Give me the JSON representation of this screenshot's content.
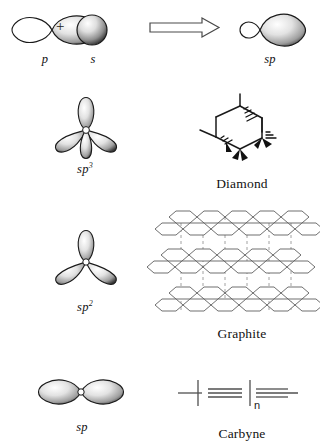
{
  "figure": {
    "background_color": "#ffffff",
    "ink_color": "#1a1a1a",
    "plus_symbol": "+",
    "rows": [
      {
        "id": "row-sp-formation",
        "orbital_labels": [
          "p",
          "s"
        ],
        "operator": "+",
        "arrow": "right-block-arrow",
        "result_label": "sp",
        "material_label": ""
      },
      {
        "id": "row-sp3-diamond",
        "orbital_labels": [
          "sp3"
        ],
        "orbital_label_base": "sp",
        "orbital_label_sup": "3",
        "material_label": "Diamond"
      },
      {
        "id": "row-sp2-graphite",
        "orbital_labels": [
          "sp2"
        ],
        "orbital_label_base": "sp",
        "orbital_label_sup": "2",
        "material_label": "Graphite"
      },
      {
        "id": "row-sp-carbyne",
        "orbital_labels": [
          "sp"
        ],
        "orbital_label_base": "sp",
        "orbital_label_sup": "",
        "material_label": "Carbyne",
        "repeat_subscript": "n"
      }
    ],
    "labels": {
      "p_orbital": "p",
      "s_orbital": "s",
      "sp_hybrid": "sp",
      "sp3_base": "sp",
      "sp3_sup": "3",
      "sp2_base": "sp",
      "sp2_sup": "2",
      "sp_base": "sp",
      "diamond": "Diamond",
      "graphite": "Graphite",
      "carbyne": "Carbyne",
      "carbyne_subscript": "n"
    },
    "colors": {
      "lobe_dark": "#2b2b2b",
      "lobe_light": "#f2f2f2",
      "lobe_mid": "#9a9a9a",
      "outline": "#1a1a1a",
      "dash": "#8a8a8a"
    }
  }
}
